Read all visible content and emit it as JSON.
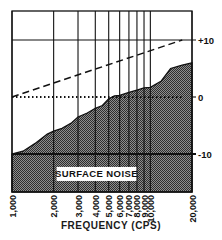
{
  "chart_data": {
    "type": "area",
    "title": "",
    "xlabel": "FREQUENCY (CPS)",
    "ylabel": "",
    "x_scale": "log",
    "x_ticks": [
      1000,
      2000,
      3000,
      4000,
      5000,
      6000,
      7000,
      8000,
      9000,
      10000,
      20000
    ],
    "x_tick_labels": [
      "1,000",
      "2,000",
      "3,000",
      "4,000",
      "5,000",
      "6,000",
      "7,000",
      "8,000",
      "9,000",
      "10,000",
      "20,000"
    ],
    "y_ticks": [
      10,
      0,
      -10
    ],
    "y_tick_labels": [
      "+10",
      "0",
      "-10"
    ],
    "ylim": [
      -16,
      15
    ],
    "grid": true,
    "legend": null,
    "series": [
      {
        "name": "Noise level (shaded)",
        "style": "filled-hatched",
        "x": [
          1000,
          1200,
          1500,
          1800,
          2000,
          2300,
          2700,
          3000,
          3500,
          4000,
          4500,
          5000,
          5500,
          6000,
          7000,
          8000,
          9000,
          10000,
          12000,
          14000,
          17000,
          20000
        ],
        "values": [
          -10,
          -9.5,
          -8,
          -6.5,
          -6,
          -5.5,
          -4.5,
          -3.5,
          -2.8,
          -2,
          -1.5,
          -0.3,
          0.2,
          0.3,
          0.8,
          1.2,
          1.6,
          1.7,
          2.8,
          5,
          5.6,
          6
        ]
      },
      {
        "name": "Pre-emphasis (dashed)",
        "style": "dashed",
        "x": [
          1000,
          17000
        ],
        "values": [
          0,
          10
        ]
      },
      {
        "name": "Reference (dotted)",
        "style": "dotted",
        "x": [
          1000,
          17000
        ],
        "values": [
          0,
          0
        ]
      }
    ],
    "annotations": [
      {
        "text": "SURFACE NOISE",
        "x_range": [
          2000,
          10000
        ],
        "y": -13.5,
        "boxed": true
      }
    ]
  },
  "colors": {
    "ink": "#111111",
    "background": "#ffffff",
    "hatch_dark": "#3a3a3a",
    "hatch_light": "#9a9a9a"
  }
}
